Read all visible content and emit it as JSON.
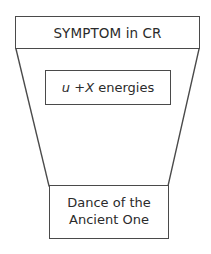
{
  "diagram": {
    "type": "funnel-flow-diagram",
    "background_color": "#ffffff",
    "stroke_color": "#4a4a4a",
    "text_color": "#2b2b2b",
    "nodes": {
      "top": {
        "label": "SYMPTOM in CR"
      },
      "middle": {
        "prefix_italic": "u",
        "plus": "+",
        "variable_italic": "X",
        "suffix": "energies",
        "full_label": "u +X energies"
      },
      "bottom": {
        "line1": "Dance of the",
        "line2": "Ancient One",
        "full_label": "Dance of the Ancient One"
      }
    },
    "connectors": {
      "left_funnel_edge": "line from top-box bottom-left corner to bottom-box top-left corner",
      "right_funnel_edge": "line from top-box bottom-right corner to bottom-box top-right corner"
    }
  }
}
